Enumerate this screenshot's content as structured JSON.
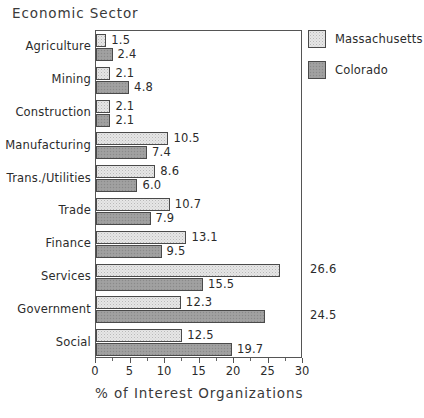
{
  "chart_data": {
    "type": "bar",
    "orientation": "horizontal",
    "title": "Economic Sector",
    "xlabel": "% of Interest Organizations",
    "ylabel": "",
    "xlim": [
      0,
      30
    ],
    "xticks": [
      0,
      5,
      10,
      15,
      20,
      25,
      30
    ],
    "xtick_labels": [
      "0",
      "5",
      "10",
      "15",
      "20",
      "25",
      "30"
    ],
    "grid": false,
    "legend_position": "right",
    "categories": [
      "Agriculture",
      "Mining",
      "Construction",
      "Manufacturing",
      "Trans./Utilities",
      "Trade",
      "Finance",
      "Services",
      "Government",
      "Social"
    ],
    "series": [
      {
        "name": "Massachusetts",
        "values": [
          1.5,
          2.1,
          2.1,
          10.5,
          8.6,
          10.7,
          13.1,
          26.6,
          12.3,
          12.5
        ],
        "labels": [
          "1.5",
          "2.1",
          "2.1",
          "10.5",
          "8.6",
          "10.7",
          "13.1",
          "26.6",
          "12.3",
          "12.5"
        ]
      },
      {
        "name": "Colorado",
        "values": [
          2.4,
          4.8,
          2.1,
          7.4,
          6.0,
          7.9,
          9.5,
          15.5,
          24.5,
          19.7
        ],
        "labels": [
          "2.4",
          "4.8",
          "2.1",
          "7.4",
          "6.0",
          "7.9",
          "9.5",
          "15.5",
          "24.5",
          "19.7"
        ]
      }
    ]
  },
  "legend": {
    "items": [
      {
        "label": "Massachusetts",
        "swatch": "light-speckle",
        "color": "#e6e6e6"
      },
      {
        "label": "Colorado",
        "swatch": "gray-fill",
        "color": "#9e9e9e"
      }
    ]
  }
}
